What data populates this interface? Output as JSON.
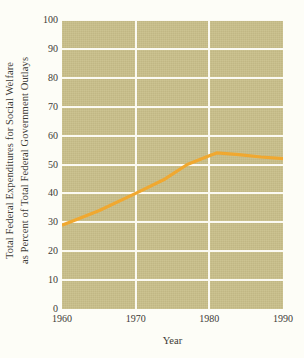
{
  "chart_data": {
    "type": "line",
    "title": "",
    "subtitle": "",
    "xlabel": "Year",
    "ylabel": "Total Federal Expenditures for Social Welfare as Percent of Total Federal Government Outlays",
    "ylabel_lines": [
      "Total Federal Expenditures for Social Welfare",
      "as Percent of Total Federal Government Outlays"
    ],
    "xlim": [
      1960,
      1990
    ],
    "ylim": [
      0,
      100
    ],
    "xticks": [
      1960,
      1970,
      1980,
      1990
    ],
    "xtick_labels": [
      "1960",
      "1970",
      "1980",
      "1990"
    ],
    "yticks": [
      0,
      10,
      20,
      30,
      40,
      50,
      60,
      70,
      80,
      90,
      100
    ],
    "ytick_labels": [
      "0",
      "10",
      "20",
      "30",
      "40",
      "50",
      "60",
      "70",
      "80",
      "90",
      "100"
    ],
    "grid": "horizontal-and-vertical",
    "gridline_color": "#fbfaf2",
    "plot_background": "#c9bf8a",
    "page_background": "#fdfdf7",
    "legend": null,
    "series": [
      {
        "name": "Social welfare share of federal outlays",
        "color": "#f0a830",
        "x": [
          1960,
          1965,
          1970,
          1974,
          1977,
          1980,
          1981,
          1984,
          1987,
          1990
        ],
        "values": [
          29,
          34,
          40,
          45,
          50,
          53,
          54,
          53.4,
          52.6,
          52
        ]
      }
    ]
  }
}
